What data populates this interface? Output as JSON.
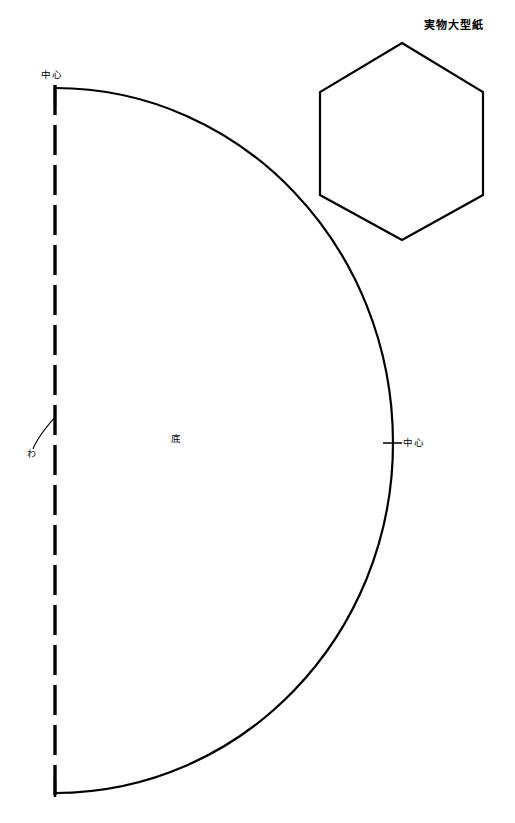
{
  "document": {
    "title": "実物大型紙",
    "background_color": "#ffffff",
    "ink_color": "#000000",
    "width": 515,
    "height": 823
  },
  "labels": {
    "title": "実物大型紙",
    "center_top": "中心",
    "center_right": "中心",
    "bottom_piece": "底",
    "fold_mark": "わ"
  },
  "pieces": [
    {
      "name": "底",
      "shape": "half-ellipse",
      "fold_edge": "わ",
      "markers": [
        "中心",
        "中心"
      ]
    },
    {
      "name": "実物大型紙",
      "shape": "hexagon",
      "markers": []
    }
  ],
  "geometry": {
    "fold_line": {
      "x": 55,
      "y_top": 85,
      "y_bottom": 798,
      "dash": "30 10"
    },
    "arc": {
      "start_x": 55,
      "start_y": 88,
      "end_x": 55,
      "end_y": 793,
      "max_x": 393,
      "mid_y": 443
    },
    "hexagon": {
      "points": "402,43 483,92 483,195 402,240 320,195 320,92"
    },
    "tick_top": {
      "x": 55,
      "y1": 88,
      "y2": 104
    },
    "tick_bottom": {
      "x": 55,
      "y1": 781,
      "y2": 798
    },
    "tick_right": {
      "x1": 384,
      "x2": 401,
      "y": 443
    },
    "fold_arc": {
      "from_x": 56,
      "from_y": 417,
      "to_x": 33,
      "to_y": 449
    }
  }
}
